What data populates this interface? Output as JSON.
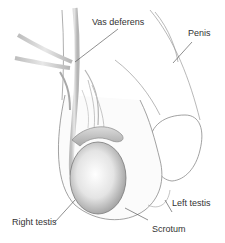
{
  "diagram": {
    "type": "anatomical-illustration",
    "labels": {
      "vas_deferens": "Vas deferens",
      "penis": "Penis",
      "left_testis": "Left testis",
      "right_testis": "Right testis",
      "scrotum": "Scrotum"
    },
    "colors": {
      "outline": "#8a8a8a",
      "leader_line": "#444444",
      "text": "#333333",
      "shade": "#c8c8c8",
      "highlight": "#ffffff"
    }
  }
}
